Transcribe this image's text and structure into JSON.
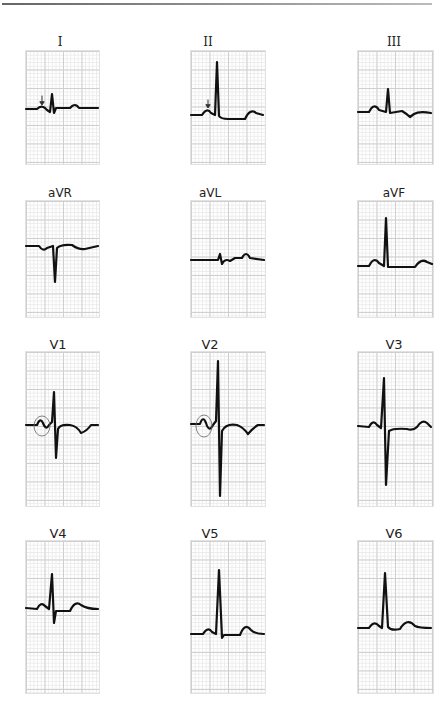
{
  "leads": [
    {
      "id": "I",
      "label": "I",
      "annotation": "arrow"
    },
    {
      "id": "II",
      "label": "II",
      "annotation": "arrow"
    },
    {
      "id": "III",
      "label": "III",
      "annotation": null
    },
    {
      "id": "aVR",
      "label": "aVR",
      "annotation": null
    },
    {
      "id": "aVL",
      "label": "aVL",
      "annotation": null
    },
    {
      "id": "aVF",
      "label": "aVF",
      "annotation": null
    },
    {
      "id": "V1",
      "label": "V1",
      "annotation": "circle"
    },
    {
      "id": "V2",
      "label": "V2",
      "annotation": "circle"
    },
    {
      "id": "V3",
      "label": "V3",
      "annotation": null
    },
    {
      "id": "V4",
      "label": "V4",
      "annotation": null
    },
    {
      "id": "V5",
      "label": "V5",
      "annotation": null
    },
    {
      "id": "V6",
      "label": "V6",
      "annotation": null
    }
  ],
  "colors": {
    "trace": "#111111",
    "grid_major": "#cfcfcf",
    "grid_minor": "#ececec"
  }
}
